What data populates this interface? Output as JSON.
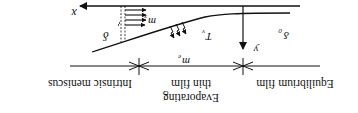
{
  "figure": {
    "orientation": "rotated-180",
    "axes": {
      "x_label": "x",
      "y_label": "y"
    },
    "symbols": {
      "delta": "δ",
      "delta0": "δ",
      "delta0_sub": "0",
      "mx": "m",
      "mx_sub": "x",
      "me": "m",
      "me_sub": "e",
      "Tv": "T",
      "Tv_sub": "v"
    },
    "regions": [
      {
        "label": "Intrinsic meniscus"
      },
      {
        "label_line1": "Evaporating",
        "label_line2": "thin film"
      },
      {
        "label": "Equilibrium film"
      }
    ],
    "colors": {
      "ink": "#111111",
      "background": "#ffffff"
    }
  }
}
